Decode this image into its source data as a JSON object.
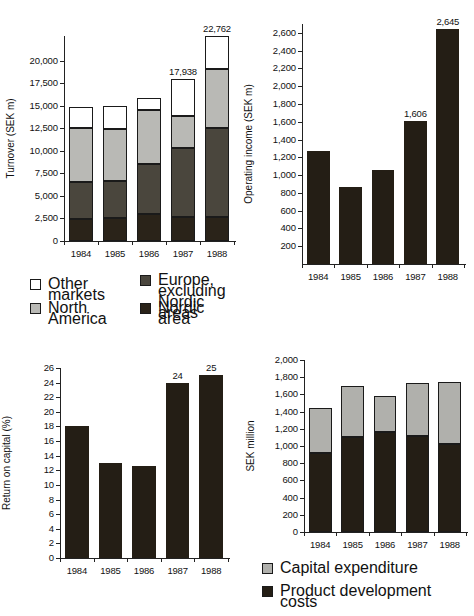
{
  "figure": {
    "background": "#ffffff",
    "colors": {
      "nordic": "#2a2319",
      "europe": "#4a463d",
      "north_america": "#b9b9b5",
      "other": "#ffffff",
      "capital_expenditure": "#b0b0ac",
      "product_development": "#241e15",
      "axis": "#222222"
    }
  },
  "chart_data": [
    {
      "id": "turnover",
      "type": "bar",
      "stacked": true,
      "title": "",
      "xlabel": "",
      "ylabel": "Turnover (SEK m)",
      "categories": [
        "1984",
        "1985",
        "1986",
        "1987",
        "1988"
      ],
      "ylim": [
        0,
        22762
      ],
      "yticks": [
        0,
        2500,
        5000,
        7500,
        10000,
        12500,
        15000,
        17500,
        20000
      ],
      "ytick_labels": [
        "0",
        "2,500",
        "5,000",
        "7,500",
        "10,000",
        "12,500",
        "15,000",
        "17,500",
        "20,000"
      ],
      "grid": false,
      "legend_position": "below",
      "series": [
        {
          "name": "Nordic area",
          "key": "nordic",
          "values": [
            2450,
            2550,
            2950,
            2700,
            2700
          ]
        },
        {
          "name": "Europe, excluding\nNordic areas",
          "key": "europe",
          "values": [
            4100,
            4100,
            5600,
            7600,
            9800
          ]
        },
        {
          "name": "North America",
          "key": "north_america",
          "values": [
            6000,
            5800,
            6000,
            3600,
            6600
          ]
        },
        {
          "name": "Other markets",
          "key": "other",
          "values": [
            2350,
            2550,
            1350,
            4038,
            3662
          ]
        }
      ],
      "totals": [
        14900,
        15000,
        15900,
        17938,
        22762
      ],
      "annotations": [
        {
          "category": "1987",
          "text": "17,938"
        },
        {
          "category": "1988",
          "text": "22,762"
        }
      ]
    },
    {
      "id": "operating-income",
      "type": "bar",
      "stacked": false,
      "title": "",
      "xlabel": "",
      "ylabel": "Operating income (SEK m)",
      "categories": [
        "1984",
        "1985",
        "1986",
        "1987",
        "1988"
      ],
      "values": [
        1270,
        865,
        1055,
        1606,
        2645
      ],
      "ylim": [
        0,
        2700
      ],
      "yticks": [
        200,
        400,
        600,
        800,
        1000,
        1200,
        1400,
        1600,
        1800,
        2000,
        2200,
        2400,
        2600
      ],
      "ytick_labels": [
        "200",
        "400",
        "600",
        "800",
        "1,000",
        "1,200",
        "1,400",
        "1,600",
        "1,800",
        "2,000",
        "2,200",
        "2,400",
        "2,600"
      ],
      "grid": false,
      "annotations": [
        {
          "category": "1987",
          "text": "1,606"
        },
        {
          "category": "1988",
          "text": "2,645"
        }
      ]
    },
    {
      "id": "return-on-capital",
      "type": "bar",
      "stacked": false,
      "title": "",
      "xlabel": "",
      "ylabel": "Return on capital (%)",
      "categories": [
        "1984",
        "1985",
        "1986",
        "1987",
        "1988"
      ],
      "values": [
        18,
        13,
        12.6,
        24,
        25
      ],
      "ylim": [
        0,
        26
      ],
      "yticks": [
        0,
        2,
        4,
        6,
        8,
        10,
        12,
        14,
        16,
        18,
        20,
        22,
        24,
        26
      ],
      "ytick_labels": [
        "0",
        "2",
        "4",
        "6",
        "8",
        "10",
        "12",
        "14",
        "16",
        "18",
        "20",
        "22",
        "24",
        "26"
      ],
      "grid": false,
      "annotations": [
        {
          "category": "1987",
          "text": "24"
        },
        {
          "category": "1988",
          "text": "25"
        }
      ]
    },
    {
      "id": "sek-million",
      "type": "bar",
      "stacked": true,
      "title": "",
      "xlabel": "",
      "ylabel": "SEK million",
      "categories": [
        "1984",
        "1985",
        "1986",
        "1987",
        "1988"
      ],
      "ylim": [
        0,
        2000
      ],
      "yticks": [
        0,
        200,
        400,
        600,
        800,
        1000,
        1200,
        1400,
        1600,
        1800,
        2000
      ],
      "ytick_labels": [
        "0",
        "200",
        "400",
        "600",
        "800",
        "1,000",
        "1,200",
        "1,400",
        "1,600",
        "1,800",
        "2,000"
      ],
      "grid": false,
      "legend_position": "below",
      "series": [
        {
          "name": "Product development costs",
          "key": "product_development",
          "values": [
            920,
            1105,
            1160,
            1120,
            1020
          ]
        },
        {
          "name": "Capital expenditure",
          "key": "capital_expenditure",
          "values": [
            525,
            590,
            425,
            610,
            720
          ]
        }
      ],
      "totals": [
        1445,
        1695,
        1585,
        1730,
        1740
      ]
    }
  ],
  "legends": {
    "turnover": [
      {
        "label": "Other markets",
        "key": "other"
      },
      {
        "label": "Europe, excluding\nNordic areas",
        "key": "europe"
      },
      {
        "label": "North America",
        "key": "north_america"
      },
      {
        "label": "Nordic area",
        "key": "nordic"
      }
    ],
    "sek_million": [
      {
        "label": "Capital expenditure",
        "key": "capital_expenditure"
      },
      {
        "label": "Product development costs",
        "key": "product_development"
      }
    ]
  }
}
